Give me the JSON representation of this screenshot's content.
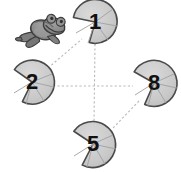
{
  "scene": {
    "title": "Frog jumping between numbered lily pads",
    "width": 181,
    "height": 172,
    "background_color": "#ffffff"
  },
  "colors": {
    "pad_fill": "#c9c9c9",
    "pad_fill_light": "#d6d6d6",
    "pad_outline": "#4a4a4a",
    "pad_vein": "#9a9a9a",
    "frog_body": "#8c8c8c",
    "frog_outline": "#3c3c3c",
    "frog_dark": "#6a6a6a",
    "dash_line": "#b5b5b5",
    "label_color": "#111111"
  },
  "frog": {
    "name": "frog",
    "label": "frog",
    "x": 44,
    "y": 28,
    "facing": "right",
    "pose": "leaping"
  },
  "pads": [
    {
      "id": "pad-1",
      "label": "1",
      "cx": 95,
      "cy": 22,
      "r": 22,
      "notch_angle": 200,
      "position": "top"
    },
    {
      "id": "pad-2",
      "label": "2",
      "cx": 32,
      "cy": 82,
      "r": 22,
      "notch_angle": 150,
      "position": "left"
    },
    {
      "id": "pad-8",
      "label": "8",
      "cx": 154,
      "cy": 83,
      "r": 23,
      "notch_angle": 160,
      "position": "right"
    },
    {
      "id": "pad-5",
      "label": "5",
      "cx": 93,
      "cy": 144,
      "r": 23,
      "notch_angle": 165,
      "position": "bottom"
    }
  ],
  "connections": [
    {
      "id": "link-2-1",
      "from": "pad-2",
      "to": "pad-1",
      "style": "dashed"
    },
    {
      "id": "link-1-5",
      "from": "pad-1",
      "to": "pad-5",
      "style": "dashed"
    },
    {
      "id": "link-2-8",
      "from": "pad-2",
      "to": "pad-8",
      "style": "dashed"
    },
    {
      "id": "link-8-5",
      "from": "pad-8",
      "to": "pad-5",
      "style": "dashed"
    }
  ]
}
